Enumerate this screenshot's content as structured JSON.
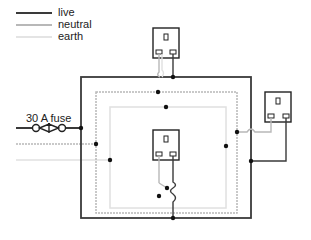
{
  "legend": {
    "items": [
      {
        "label": "live",
        "color": "#3a3a3a"
      },
      {
        "label": "neutral",
        "color": "#b8b8b8"
      },
      {
        "label": "earth",
        "color": "#e4e4e4"
      }
    ]
  },
  "fuse": {
    "label": "30 A fuse"
  },
  "sockets": [
    {
      "name": "top-socket"
    },
    {
      "name": "centre-socket"
    },
    {
      "name": "right-socket"
    }
  ],
  "colors": {
    "live": "#3a3a3a",
    "neutral": "#b8b8b8",
    "earth": "#e0e0e0",
    "socket_outline": "#222222"
  }
}
